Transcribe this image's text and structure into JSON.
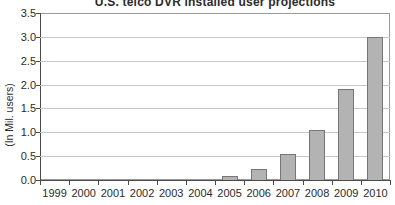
{
  "chart_data": {
    "type": "bar",
    "title": "U.S. telco DVR installed user projections",
    "ylabel": "(In Mil. users)",
    "xlabel": "",
    "categories": [
      "1999",
      "2000",
      "2001",
      "2002",
      "2003",
      "2004",
      "2005",
      "2006",
      "2007",
      "2008",
      "2009",
      "2010"
    ],
    "values": [
      0,
      0,
      0,
      0,
      0,
      0,
      0.08,
      0.23,
      0.55,
      1.05,
      1.9,
      3.0
    ],
    "ylim": [
      0,
      3.5
    ],
    "ytick_step": 0.5,
    "yticks": [
      "0.0",
      "0.5",
      "1.0",
      "1.5",
      "2.0",
      "2.5",
      "3.0",
      "3.5"
    ],
    "grid": "horizontal",
    "legend": "none",
    "series_name": "Installed users (millions)"
  },
  "colors": {
    "bar_fill": "#b3b3b3",
    "bar_border": "#767676",
    "gridline": "#c6c6c6",
    "axis": "#4a4a4a",
    "frame": "#9a9a9a",
    "text": "#2b2b2b",
    "background": "#ffffff"
  }
}
